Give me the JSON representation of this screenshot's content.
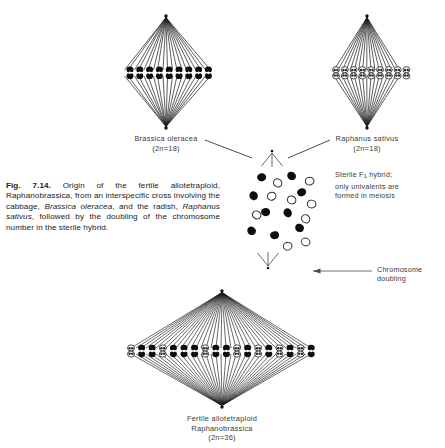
{
  "figure": {
    "number": "Fig. 7.14.",
    "caption_text": "Origin of the fertile allotetraploid, Raphanobrassica, from an interspecific cross involving the cabbage, Brassica oleracea, and the radish, Raphanus sativus, followed by the doubling of the chromosome number in the sterile hybrid.",
    "caption_segments": {
      "label": "Fig. 7.14.",
      "s1": " Origin of the fertile allotetraploid, Raphanobrassica, from an interspecific cross involving the cabbage, ",
      "i1": "Brassica oleracea",
      "s2": ", and the radish, ",
      "i2": "Raphanus sativus",
      "s3": ", followed by the doubling of the chromosome number in the sterile hybrid."
    }
  },
  "parents": {
    "left": {
      "species": "Brassica oleracea",
      "chromosome_formula": "(2n=18)",
      "bivalent_count": 9,
      "chromosome_style": "solid-dark"
    },
    "right": {
      "species": "Raphanus sativus",
      "chromosome_formula": "(2n=18)",
      "bivalent_count": 9,
      "chromosome_style": "open-outline"
    }
  },
  "hybrid": {
    "annotation_line_1": "Sterile F",
    "annotation_subscript": "1",
    "annotation_line_1_rest": " hybrid;",
    "annotation_line_2": "only univalents are",
    "annotation_line_3": "formed in meiosis",
    "univalents_dark": 9,
    "univalents_open": 9
  },
  "doubling": {
    "arrow_label_line_1": "Chromosome",
    "arrow_label_line_2": "doubling"
  },
  "offspring": {
    "title": "Fertile allotetraploid",
    "species": "Raphanobrassica",
    "chromosome_formula": "(2n=36)",
    "bivalent_count": 18
  },
  "colors": {
    "ink": "#1a1a1a",
    "caption_ink": "#1b1b1b",
    "label_ink": "#3a3a3a",
    "background": "#ffffff",
    "chromosome_dark": "#0d0d0d",
    "chromosome_open_stroke": "#2b2b2b"
  }
}
